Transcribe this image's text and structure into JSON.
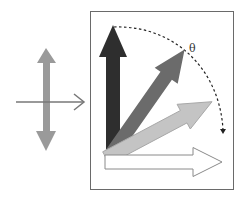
{
  "diagram": {
    "left_panel": {
      "description": "Linearly polarized light propagating to the right",
      "polarization_arrow_color": "#9a9a9a",
      "propagation_arrow_color": "#777777"
    },
    "right_panel": {
      "description": "Polarization vector rotated through angle theta",
      "frame_color": "#6a6a6a",
      "rotation_label": "θ",
      "arrows": [
        {
          "name": "vertical",
          "angle_deg": 90,
          "fill": "#2e2e2e"
        },
        {
          "name": "oblique-steep",
          "angle_deg": 55,
          "fill": "#6b6b6b"
        },
        {
          "name": "oblique-shallow",
          "angle_deg": 28,
          "fill": "#c4c4c4"
        },
        {
          "name": "horizontal",
          "angle_deg": 0,
          "fill": "#ffffff"
        }
      ],
      "arc": {
        "style": "dashed",
        "color": "#222222",
        "direction": "clockwise"
      }
    }
  }
}
